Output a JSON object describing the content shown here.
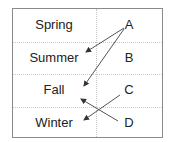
{
  "diagram": {
    "left_column": [
      "Spring",
      "Summer",
      "Fall",
      "Winter"
    ],
    "right_column": [
      "A",
      "B",
      "C",
      "D"
    ],
    "arrows": [
      {
        "from": "A",
        "to": "Summer"
      },
      {
        "from": "A",
        "to": "Fall"
      },
      {
        "from": "C",
        "to": "Winter"
      },
      {
        "from": "D",
        "to": "Fall"
      }
    ],
    "colors": {
      "border": "#8a8a8a",
      "gridline": "#c8c8c8",
      "arrow": "#444444",
      "text": "#222222"
    }
  }
}
